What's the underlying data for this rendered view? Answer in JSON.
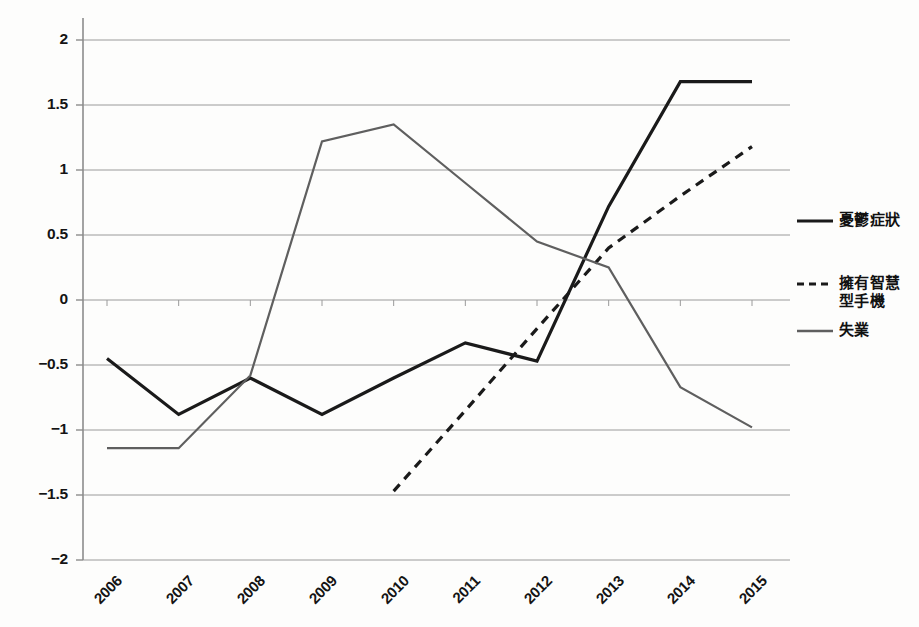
{
  "chart_data": {
    "type": "line",
    "title": "",
    "subtitle": "",
    "xlabel": "",
    "ylabel": "",
    "categories": [
      "2006",
      "2007",
      "2008",
      "2009",
      "2010",
      "2011",
      "2012",
      "2013",
      "2014",
      "2015"
    ],
    "xlim": [
      2006,
      2015
    ],
    "ylim": [
      -2,
      2
    ],
    "ytick_labels": [
      "2",
      "1.5",
      "1",
      "0.5",
      "0",
      "-0.5",
      "-1",
      "-1.5",
      "-2"
    ],
    "ytick_values": [
      2,
      1.5,
      1,
      0.5,
      0,
      -0.5,
      -1,
      -1.5,
      -2
    ],
    "grid": "horizontal",
    "legend_position": "right",
    "series": [
      {
        "name": "憂鬱症狀",
        "style": "solid",
        "color": "#1a1a1a",
        "width": 3.2,
        "x": [
          "2006",
          "2007",
          "2008",
          "2009",
          "2010",
          "2011",
          "2012",
          "2013",
          "2014",
          "2015"
        ],
        "values": [
          -0.45,
          -0.88,
          -0.6,
          -0.88,
          -0.6,
          -0.33,
          -0.47,
          0.72,
          1.68,
          1.68
        ]
      },
      {
        "name": "擁有智慧型手機",
        "style": "dashed",
        "color": "#1a1a1a",
        "width": 3.2,
        "x": [
          "2010",
          "2011",
          "2012",
          "2013",
          "2014",
          "2015"
        ],
        "values": [
          -1.47,
          -0.85,
          -0.22,
          0.4,
          0.8,
          1.18
        ]
      },
      {
        "name": "失業",
        "style": "solid",
        "color": "#5f5f5f",
        "width": 2.2,
        "x": [
          "2006",
          "2007",
          "2008",
          "2009",
          "2010",
          "2011",
          "2012",
          "2013",
          "2014",
          "2015"
        ],
        "values": [
          -1.14,
          -1.14,
          -0.58,
          1.22,
          1.35,
          0.9,
          0.45,
          0.25,
          -0.67,
          -0.98
        ]
      }
    ]
  },
  "legend": {
    "items": [
      {
        "label": "憂鬱症狀",
        "label2": "",
        "style": "solid",
        "color": "#1a1a1a"
      },
      {
        "label": "擁有智慧",
        "label2": "型手機",
        "style": "dashed",
        "color": "#1a1a1a"
      },
      {
        "label": "失業",
        "label2": "",
        "style": "solid",
        "color": "#5f5f5f"
      }
    ]
  },
  "axes": {
    "y_axis_name": "value-axis",
    "x_axis_name": "year-axis"
  }
}
